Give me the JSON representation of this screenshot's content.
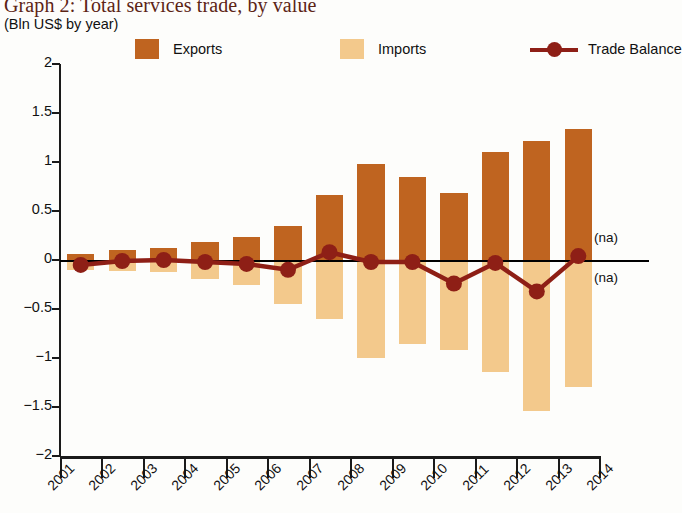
{
  "title": "Graph 2: Total services trade, by value",
  "subtitle": "(Bln US$ by year)",
  "colors": {
    "exports": "#bf6420",
    "imports": "#f3c98c",
    "trade_balance": "#8e1f16",
    "title": "#5c2415",
    "axis": "#1a1a1a"
  },
  "legend": [
    {
      "label": "Exports",
      "marker": "square-swatch"
    },
    {
      "label": "Imports",
      "marker": "square-swatch"
    },
    {
      "label": "Trade Balance",
      "marker": "line-with-dot"
    }
  ],
  "annotations": [
    {
      "text": "(na)",
      "position": "above-zero-right"
    },
    {
      "text": "(na)",
      "position": "below-zero-right"
    }
  ],
  "chart_data": {
    "type": "bar",
    "title": "Graph 2: Total services trade, by value",
    "subtitle": "(Bln US$ by year)",
    "xlabel": "",
    "ylabel": "Bln US$ by year",
    "ylim": [
      -2,
      2
    ],
    "ytick_labels": [
      "2",
      "1.5",
      "1",
      "0.5",
      "0",
      "-0.5",
      "-1",
      "-1.5",
      "-2"
    ],
    "ytick_values": [
      2,
      1.5,
      1,
      0.5,
      0,
      -0.5,
      -1,
      -1.5,
      -2
    ],
    "grid": false,
    "legend_position": "top",
    "xtick_labels": [
      "2001",
      "2002",
      "2003",
      "2004",
      "2005",
      "2006",
      "2007",
      "2008",
      "2009",
      "2010",
      "2011",
      "2012",
      "2013",
      "2014"
    ],
    "categories": [
      "2001",
      "2002",
      "2003",
      "2004",
      "2005",
      "2006",
      "2007",
      "2008",
      "2009",
      "2010",
      "2011",
      "2012",
      "2013"
    ],
    "series": [
      {
        "name": "Exports",
        "type": "bar",
        "color": "#bf6420",
        "values": [
          0.06,
          0.1,
          0.12,
          0.18,
          0.23,
          0.35,
          0.66,
          0.98,
          0.85,
          0.68,
          1.1,
          1.21,
          1.34
        ]
      },
      {
        "name": "Imports",
        "type": "bar",
        "color": "#f3c98c",
        "values": [
          -0.1,
          -0.11,
          -0.12,
          -0.19,
          -0.26,
          -0.45,
          -0.6,
          -1.0,
          -0.86,
          -0.92,
          -1.14,
          -1.54,
          -1.3
        ]
      },
      {
        "name": "Trade Balance",
        "type": "line",
        "color": "#8e1f16",
        "values": [
          -0.05,
          -0.01,
          0.0,
          -0.02,
          -0.04,
          -0.1,
          0.08,
          -0.02,
          -0.02,
          -0.24,
          -0.03,
          -0.32,
          0.04
        ]
      }
    ]
  }
}
